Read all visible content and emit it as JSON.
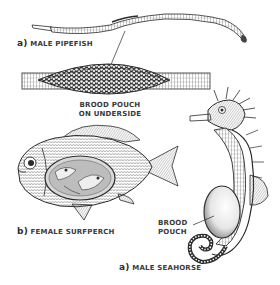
{
  "figure": {
    "subjects": [
      {
        "id": "pipefish",
        "prefix": "a)",
        "name": "MALE PIPEFISH"
      },
      {
        "id": "surfperch",
        "prefix": "b)",
        "name": "FEMALE SURFPERCH"
      },
      {
        "id": "seahorse",
        "prefix": "a)",
        "name": "MALE SEAHORSE"
      }
    ],
    "callouts": {
      "pipefish_pouch_line1": "BROOD POUCH",
      "pipefish_pouch_line2": "ON UNDERSIDE",
      "seahorse_pouch_line1": "BROOD",
      "seahorse_pouch_line2": "POUCH"
    },
    "colors": {
      "ink": "#2b2b2b",
      "label": "#3a3a3a",
      "background": "#ffffff",
      "shade": "#9a9a9a"
    }
  }
}
